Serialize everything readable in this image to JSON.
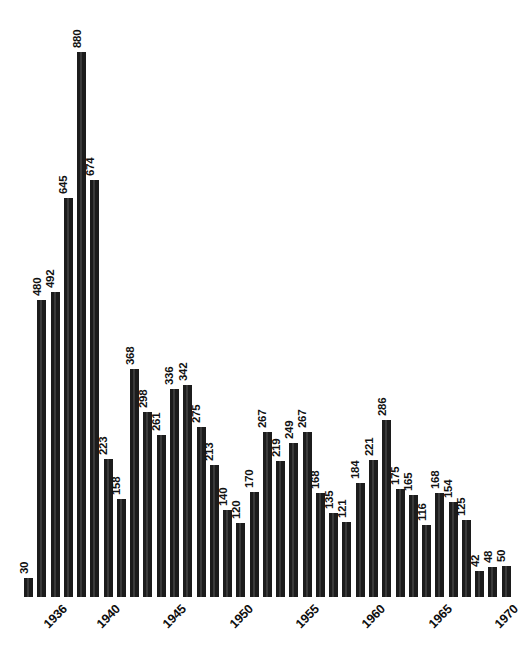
{
  "chart_data": {
    "type": "bar",
    "title": "",
    "subtitle": "",
    "xlabel": "",
    "ylabel": "",
    "grid": false,
    "legend": null,
    "orientation": "vertical",
    "bar_color": "#1c1c1c",
    "background_color": "#ffffff",
    "value_labels_rotation": -90,
    "tick_labels_rotation": -45,
    "ylim": [
      0,
      880
    ],
    "categories": [
      "1936",
      "1937",
      "1938",
      "1939",
      "1940",
      "1941",
      "1942",
      "1943",
      "1944",
      "1945",
      "1946",
      "1947",
      "1948",
      "1949",
      "1950",
      "1951",
      "1952",
      "1953",
      "1954",
      "1955",
      "1956",
      "1957",
      "1958",
      "1959",
      "1960",
      "1961",
      "1962",
      "1963",
      "1964",
      "1965",
      "1966",
      "1967",
      "1968",
      "1969",
      "1970",
      "1971",
      "1972"
    ],
    "values": [
      30,
      480,
      492,
      645,
      880,
      674,
      223,
      158,
      368,
      298,
      261,
      336,
      342,
      275,
      213,
      140,
      120,
      170,
      267,
      219,
      249,
      267,
      168,
      135,
      121,
      184,
      221,
      286,
      175,
      165,
      116,
      168,
      154,
      125,
      42,
      48,
      50
    ],
    "tick_labels": [
      "1936",
      "1940",
      "1945",
      "1950",
      "1955",
      "1960",
      "1965",
      "1970"
    ],
    "tick_label_indices": [
      0,
      4,
      9,
      14,
      19,
      24,
      29,
      34
    ]
  }
}
